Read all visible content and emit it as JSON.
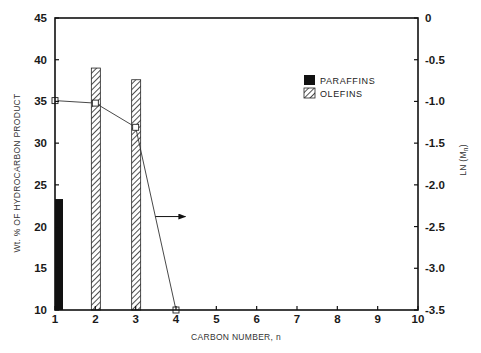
{
  "chart_data": {
    "type": "bar",
    "title": "",
    "xlabel": "CARBON NUMBER, n",
    "ylabel": "Wt. % OF HYDROCARBON PRODUCT",
    "y2label": "LN (Mn)",
    "y2label_main": "LN (M",
    "y2label_sub": "n",
    "y2label_close": ")",
    "xlim": [
      1,
      10
    ],
    "ylim": [
      10,
      45
    ],
    "y2lim": [
      -3.5,
      0
    ],
    "x_ticks": [
      1,
      2,
      3,
      4,
      5,
      6,
      7,
      8,
      9,
      10
    ],
    "y_ticks": [
      10,
      15,
      20,
      25,
      30,
      35,
      40,
      45
    ],
    "y2_ticks": [
      "0",
      "-0.5",
      "-1.0",
      "-1.5",
      "-2.0",
      "-2.5",
      "-3.0",
      "-3.5"
    ],
    "y2_tick_values": [
      0,
      -0.5,
      -1.0,
      -1.5,
      -2.0,
      -2.5,
      -3.0,
      -3.5
    ],
    "grid": false,
    "legend_position": "upper right",
    "legend": [
      {
        "name": "PARAFFINS",
        "style": "solid-black"
      },
      {
        "name": "OLEFINS",
        "style": "hatched"
      }
    ],
    "series": [
      {
        "name": "PARAFFINS",
        "type": "bar",
        "axis": "left",
        "x": [
          1
        ],
        "values": [
          23.3
        ]
      },
      {
        "name": "OLEFINS",
        "type": "bar",
        "axis": "left",
        "x": [
          2,
          3
        ],
        "values": [
          39.0,
          37.6
        ]
      },
      {
        "name": "LN (Mn)",
        "type": "line",
        "axis": "right",
        "marker": "open-square",
        "x": [
          1,
          2,
          3,
          4
        ],
        "values": [
          -0.99,
          -1.02,
          -1.31,
          -3.5
        ]
      }
    ],
    "annotations": [
      {
        "type": "arrow",
        "direction": "right",
        "meaning": "line series refers to right axis",
        "x_from": 3.25,
        "x_to": 3.3,
        "y2_at": -2.38
      }
    ]
  }
}
